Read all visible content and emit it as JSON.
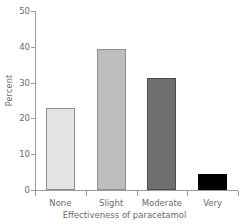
{
  "chart_data": {
    "type": "bar",
    "title": "",
    "xlabel": "Effectiveness of paracetamol",
    "ylabel": "Percent",
    "categories": [
      "None",
      "Slight",
      "Moderate",
      "Very"
    ],
    "values": [
      22.8,
      39.5,
      31.2,
      4.5
    ],
    "series": [
      {
        "name": "Percent",
        "values": [
          22.8,
          39.5,
          31.2,
          4.5
        ]
      }
    ],
    "bar_colors": [
      "#E3E3E3",
      "#BEBEBE",
      "#6F6F6F",
      "#000000"
    ],
    "ylim": [
      0,
      50
    ],
    "yticks": [
      0,
      10,
      20,
      30,
      40,
      50
    ],
    "ytick_labels": [
      "0",
      "10",
      "20",
      "30",
      "40",
      "50"
    ],
    "grid": false,
    "legend": "none"
  }
}
